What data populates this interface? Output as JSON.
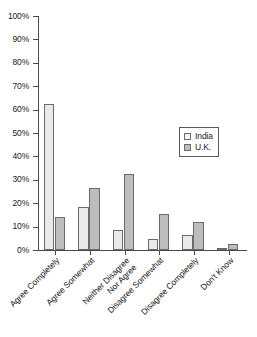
{
  "chart_data": {
    "type": "bar",
    "title": "",
    "subtitle": "",
    "xlabel": "",
    "ylabel": "",
    "ylim": [
      0,
      100
    ],
    "ytick_step": 10,
    "grid": false,
    "legend_position": "upper-right-inside",
    "value_suffix": "%",
    "categories": [
      "Agree Completely",
      "Agree Somewhat",
      "Neither Disagree Nor Agree",
      "Disagree Somewhat",
      "Disagree Completely",
      "Don't Know"
    ],
    "category_lines": [
      [
        "Agree Completely"
      ],
      [
        "Agree Somewhat"
      ],
      [
        "Neither Disagree",
        "Nor Agree"
      ],
      [
        "Disagree Somewhat"
      ],
      [
        "Disagree Completely"
      ],
      [
        "Don't Know"
      ]
    ],
    "ytick_labels": [
      "100%",
      "90%",
      "80%",
      "70%",
      "60%",
      "50%",
      "40%",
      "30%",
      "20%",
      "10%",
      "0%"
    ],
    "ytick_values": [
      100,
      90,
      80,
      70,
      60,
      50,
      40,
      30,
      20,
      10,
      0
    ],
    "series": [
      {
        "name": "India",
        "color": "#e9e9e9",
        "edge_color": "#6b6b6b",
        "values": [
          62.5,
          18.5,
          8.5,
          4.5,
          6.5,
          1
        ]
      },
      {
        "name": "U.K.",
        "color": "#bdbdbd",
        "edge_color": "#6b6b6b",
        "values": [
          14,
          26.5,
          32.5,
          15.5,
          12,
          2.5
        ]
      }
    ]
  },
  "legend": {
    "entries": [
      {
        "label": "India",
        "swatch": "india"
      },
      {
        "label": "U.K.",
        "swatch": "uk"
      }
    ]
  },
  "caption": {
    "sliver_text": ""
  }
}
